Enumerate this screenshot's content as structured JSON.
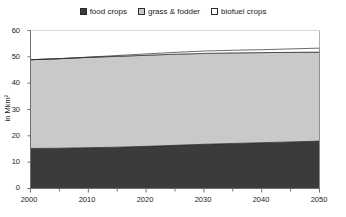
{
  "legend": {
    "position": "top-center",
    "items": [
      {
        "label": "food crops",
        "swatch": "legend-swatch-food-crops",
        "color": "#3b3b3b"
      },
      {
        "label": "grass & fodder",
        "swatch": "legend-swatch-grass-fodder",
        "color": "#c9c9c9"
      },
      {
        "label": "biofuel crops",
        "swatch": "legend-swatch-biofuel-crops",
        "color": "#ffffff"
      }
    ]
  },
  "axes": {
    "y": {
      "title": "in Mkm²",
      "ticks": [
        "0",
        "10",
        "20",
        "30",
        "40",
        "50",
        "60"
      ],
      "min": 0,
      "max": 60,
      "step": 10
    },
    "x": {
      "ticks": [
        "2000",
        "2010",
        "2020",
        "2030",
        "2040",
        "2050"
      ],
      "min": 2000,
      "max": 2050,
      "step": 10,
      "minor_step": 5
    }
  },
  "chart_data": {
    "type": "area",
    "stacked": true,
    "title": "",
    "subtitle": "",
    "xlabel": "",
    "ylabel": "in Mkm²",
    "xlim": [
      2000,
      2050
    ],
    "ylim": [
      0,
      60
    ],
    "grid": false,
    "legend_position": "top-center",
    "x": [
      2000,
      2005,
      2010,
      2015,
      2020,
      2025,
      2030,
      2035,
      2040,
      2045,
      2050
    ],
    "series": [
      {
        "name": "food crops",
        "color": "#3b3b3b",
        "values": [
          15.2,
          15.3,
          15.5,
          15.7,
          16.0,
          16.4,
          16.8,
          17.1,
          17.4,
          17.7,
          18.0
        ]
      },
      {
        "name": "grass & fodder",
        "color": "#c9c9c9",
        "values": [
          33.7,
          34.0,
          34.3,
          34.5,
          34.6,
          34.6,
          34.5,
          34.4,
          34.2,
          34.0,
          33.8
        ]
      },
      {
        "name": "biofuel crops",
        "color": "#ffffff",
        "values": [
          0.0,
          0.0,
          0.1,
          0.3,
          0.5,
          0.7,
          0.9,
          1.0,
          1.1,
          1.3,
          1.5
        ]
      }
    ],
    "totals": [
      48.9,
      49.3,
      49.9,
      50.5,
      51.1,
      51.7,
      52.2,
      52.5,
      52.7,
      53.0,
      53.3
    ]
  }
}
